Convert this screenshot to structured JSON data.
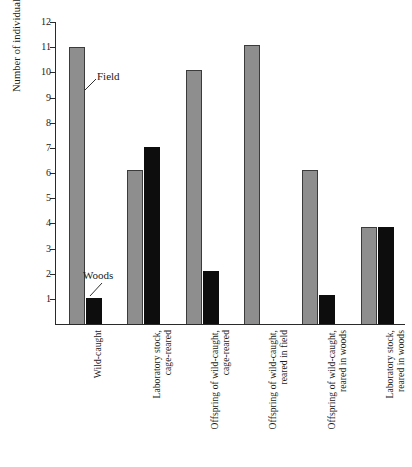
{
  "chart_data": {
    "type": "bar",
    "title": "",
    "xlabel": "",
    "ylabel": "Number of individuals selecting",
    "ylim": [
      0,
      12
    ],
    "yticks": [
      1,
      2,
      3,
      4,
      5,
      6,
      7,
      8,
      9,
      10,
      11,
      12
    ],
    "grid": false,
    "legend_position": "inline-annotation",
    "categories": [
      "Wild-caught",
      "Laboratory stock,\ncage-reared",
      "Offspring of wild-caught,\ncage-reared",
      "Offspring of wild-caught,\nreared in field",
      "Offspring of wild-caught,\nreared in woods",
      "Laboratory stock,\nreared in woods"
    ],
    "series": [
      {
        "name": "Field",
        "color": "#8e8e8e",
        "values": [
          11,
          6.1,
          10.1,
          11.1,
          6.1,
          3.85
        ]
      },
      {
        "name": "Woods",
        "color": "#0d0d0d",
        "values": [
          1.05,
          7.05,
          2.1,
          0,
          1.15,
          3.85
        ]
      }
    ],
    "annotations": [
      {
        "label": "Field",
        "series": "Field",
        "points_to_category": "Wild-caught"
      },
      {
        "label": "Woods",
        "series": "Woods",
        "points_to_category": "Wild-caught"
      }
    ]
  },
  "axis": {
    "y_title": "Number of individuals selecting",
    "tick_labels": [
      "1",
      "2",
      "3",
      "4",
      "5",
      "6",
      "7",
      "8",
      "9",
      "10",
      "11",
      "12"
    ]
  }
}
